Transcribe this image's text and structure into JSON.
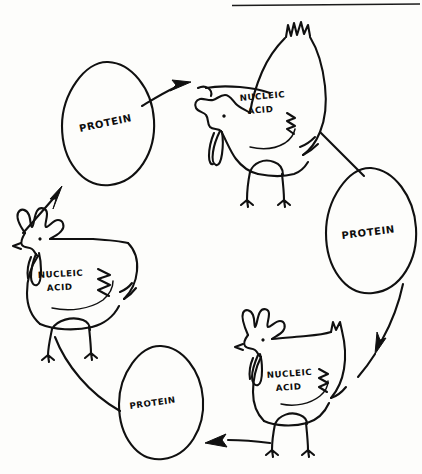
{
  "figure": {
    "background_color": "#fdfdfb",
    "ink_color": "#101010"
  },
  "top_rule": {
    "name": "top-right-horizontal-rule",
    "x1": 232,
    "y1": 5,
    "x2": 420,
    "y2": 4
  },
  "nodes": [
    {
      "id": "egg-top-left",
      "kind": "egg",
      "label": "PROTEIN",
      "label_rotation": -12,
      "cx": 108,
      "cy": 124,
      "rx": 47,
      "ry": 62
    },
    {
      "id": "chicken-top",
      "kind": "chicken",
      "label_line1": "NUCLEIC",
      "label_line2": "ACID",
      "facing": "left",
      "cx": 263,
      "cy": 105
    },
    {
      "id": "egg-right",
      "kind": "egg",
      "label": "PROTEIN",
      "label_rotation": -7,
      "cx": 371,
      "cy": 231,
      "rx": 45,
      "ry": 63
    },
    {
      "id": "chicken-bottom",
      "kind": "chicken",
      "label_line1": "NUCLEIC",
      "label_line2": "ACID",
      "facing": "left",
      "cx": 290,
      "cy": 381
    },
    {
      "id": "egg-bottom-left",
      "kind": "egg",
      "label": "PROTEIN",
      "label_rotation": -8,
      "cx": 161,
      "cy": 403,
      "rx": 43,
      "ry": 57
    },
    {
      "id": "chicken-left",
      "kind": "chicken",
      "label_line1": "NUCLEIC",
      "label_line2": "ACID",
      "facing": "left",
      "cx": 72,
      "cy": 272
    }
  ],
  "arrows": [
    {
      "id": "arrow-egg-topleft-to-chicken-top",
      "from": "egg-top-left",
      "to": "chicken-top",
      "direction": "right"
    },
    {
      "id": "arrow-chicken-top-to-egg-right",
      "from": "chicken-top",
      "to": "egg-right",
      "direction": "down-right"
    },
    {
      "id": "arrow-egg-right-to-chicken-bottom",
      "from": "egg-right",
      "to": "chicken-bottom",
      "direction": "down-left"
    },
    {
      "id": "arrow-chicken-bottom-to-egg-bottomleft",
      "from": "chicken-bottom",
      "to": "egg-bottom-left",
      "direction": "left"
    },
    {
      "id": "arrow-egg-bottomleft-to-chicken-left",
      "from": "egg-bottom-left",
      "to": "chicken-left",
      "direction": "up-left"
    },
    {
      "id": "arrow-chicken-left-to-egg-topleft",
      "from": "chicken-left",
      "to": "egg-top-left",
      "direction": "up-right"
    }
  ],
  "labels": {
    "protein": "PROTEIN",
    "nucleic": "NUCLEIC",
    "acid": "ACID"
  }
}
